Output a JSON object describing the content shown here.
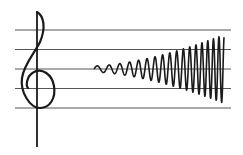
{
  "figure": {
    "staff": {
      "line_count": 5,
      "color": "#555555"
    },
    "clef": {
      "type": "treble-clef",
      "color": "#1a1a1a"
    },
    "wave": {
      "type": "growing-sine-wave",
      "cycles": 18,
      "amplitude_start_ratio": 0.08,
      "amplitude_end_ratio": 0.9,
      "color": "#1a1a1a"
    }
  }
}
